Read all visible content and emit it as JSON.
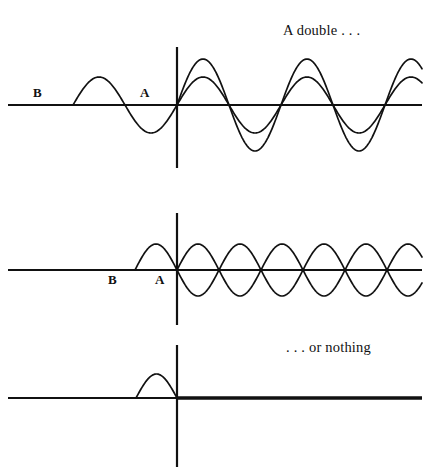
{
  "figure": {
    "background_color": "#ffffff",
    "ink_color": "#111111",
    "width": 436,
    "height": 475
  },
  "captions": {
    "top_right": "A double . . .",
    "bottom_right": ". . . or nothing"
  },
  "panels": [
    {
      "id": "panel-superposition",
      "name": "a-double",
      "origin": {
        "x": 177,
        "y": 105
      },
      "x_axis": {
        "x1": 8,
        "x2": 422,
        "y": 105,
        "stroke_width": 2.2
      },
      "y_axis": {
        "x": 177,
        "y1": 47,
        "y2": 168,
        "stroke_width": 2.2
      },
      "labels": [
        {
          "text": "B",
          "x": 33,
          "y": 97
        },
        {
          "text": "A",
          "x": 140,
          "y": 97
        }
      ],
      "caption_ref": "top_right",
      "waves": [
        {
          "name": "incoming-wave",
          "kind": "sine",
          "amplitude": 28,
          "wavelength": 104,
          "phase_deg": 0,
          "x_start": 73,
          "x_end": 422,
          "description": "single incoming sine wave, one hump left of origin then continuing right"
        },
        {
          "name": "doubled-wave",
          "kind": "sine",
          "amplitude": 46,
          "wavelength": 104,
          "phase_deg": 0,
          "x_start": 177,
          "x_end": 422,
          "description": "larger amplitude sine starting at origin (constructive superposition)"
        }
      ]
    },
    {
      "id": "panel-standing",
      "name": "standing-lenses",
      "origin": {
        "x": 177,
        "y": 270
      },
      "x_axis": {
        "x1": 8,
        "x2": 422,
        "y": 270,
        "stroke_width": 2.2
      },
      "y_axis": {
        "x": 177,
        "y1": 213,
        "y2": 325,
        "stroke_width": 2.2
      },
      "labels": [
        {
          "text": "B",
          "x": 108,
          "y": 284
        },
        {
          "text": "A",
          "x": 155,
          "y": 284
        }
      ],
      "waves": [
        {
          "name": "incoming-half-hump",
          "kind": "half-sine-positive",
          "amplitude": 26,
          "wavelength": 84,
          "x_start": 135,
          "x_end": 177,
          "description": "single positive half hump arriving at origin"
        },
        {
          "name": "lens-train-upper",
          "kind": "abs-sine-positive",
          "amplitude": 26,
          "wavelength": 84,
          "x_start": 177,
          "x_end": 422,
          "description": "train of positive arcs right of origin"
        },
        {
          "name": "lens-train-lower",
          "kind": "abs-sine-negative",
          "amplitude": 26,
          "wavelength": 84,
          "x_start": 177,
          "x_end": 422,
          "description": "mirrored train of negative arcs forming lens shapes"
        }
      ]
    },
    {
      "id": "panel-cancellation",
      "name": "or-nothing",
      "origin": {
        "x": 177,
        "y": 398
      },
      "x_axis": {
        "x1": 8,
        "x2": 422,
        "y": 398,
        "stroke_width": 2.2
      },
      "y_axis": {
        "x": 177,
        "y1": 345,
        "y2": 467,
        "stroke_width": 2.2
      },
      "labels": [],
      "caption_ref": "bottom_right",
      "waves": [
        {
          "name": "incoming-half-hump",
          "kind": "half-sine-positive",
          "amplitude": 24,
          "wavelength": 82,
          "x_start": 136,
          "x_end": 177,
          "description": "lone positive half hump left of origin"
        },
        {
          "name": "null-result-line",
          "kind": "flat",
          "amplitude": 0,
          "x_start": 177,
          "x_end": 422,
          "stroke_width": 3.4,
          "description": "thick flat zero line right of origin: total destructive cancellation"
        }
      ]
    }
  ]
}
